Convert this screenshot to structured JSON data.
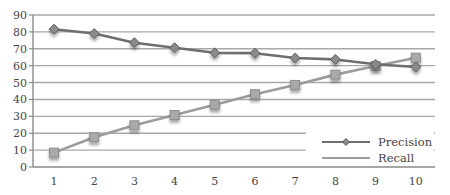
{
  "chart_data": {
    "type": "line",
    "title": "",
    "xlabel": "",
    "ylabel": "",
    "x": [
      "1",
      "2",
      "3",
      "4",
      "5",
      "6",
      "7",
      "8",
      "9",
      "10"
    ],
    "ylim": [
      0,
      90
    ],
    "yticks": [
      "0",
      "10",
      "20",
      "30",
      "40",
      "50",
      "60",
      "70",
      "80",
      "90"
    ],
    "grid": true,
    "legend_position": "bottom-right",
    "series": [
      {
        "name": "Precision",
        "marker": "diamond",
        "color": "#6e6e6e",
        "values": [
          81.6,
          79.0,
          73.6,
          70.6,
          67.6,
          67.4,
          64.5,
          63.7,
          60.8,
          59.2
        ]
      },
      {
        "name": "Recall",
        "marker": "square",
        "color": "#9c9c9c",
        "values": [
          8.5,
          17.6,
          24.7,
          30.8,
          36.9,
          43.1,
          48.6,
          54.7,
          59.8,
          64.7
        ]
      }
    ]
  },
  "colors": {
    "grid": "#a8a8a8",
    "axis": "#8a8a8a",
    "text": "#444444"
  }
}
